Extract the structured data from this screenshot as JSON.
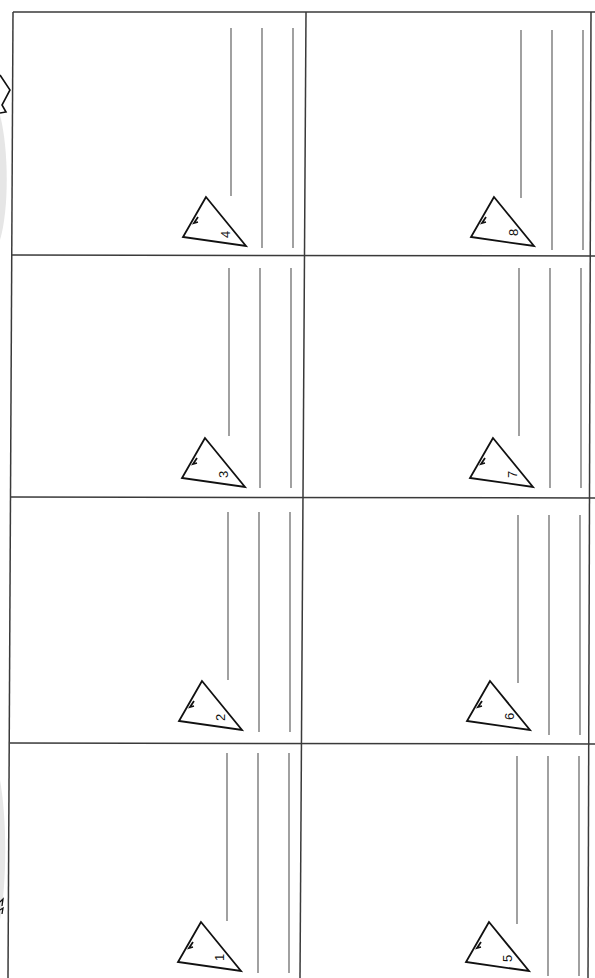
{
  "worksheet": {
    "layout": {
      "columns": 2,
      "rows": 4,
      "orientation": "rotated-90"
    },
    "colors": {
      "border": "#3a3a3a",
      "answer_line": "#6e6e6e",
      "triangle_stroke": "#111111",
      "left_strip_shape": "#e4e4e4"
    },
    "cells": [
      {
        "number": "1",
        "icon": "triangle-icon",
        "answer_lines": 3
      },
      {
        "number": "2",
        "icon": "triangle-icon",
        "answer_lines": 3
      },
      {
        "number": "3",
        "icon": "triangle-icon",
        "answer_lines": 3
      },
      {
        "number": "4",
        "icon": "triangle-icon",
        "answer_lines": 3
      },
      {
        "number": "5",
        "icon": "triangle-icon",
        "answer_lines": 3
      },
      {
        "number": "6",
        "icon": "triangle-icon",
        "answer_lines": 3
      },
      {
        "number": "7",
        "icon": "triangle-icon",
        "answer_lines": 3
      },
      {
        "number": "8",
        "icon": "triangle-icon",
        "answer_lines": 3
      }
    ],
    "left_strip": {
      "icons": [
        "star-outline-icon",
        "leaf-shape-icon"
      ]
    }
  }
}
